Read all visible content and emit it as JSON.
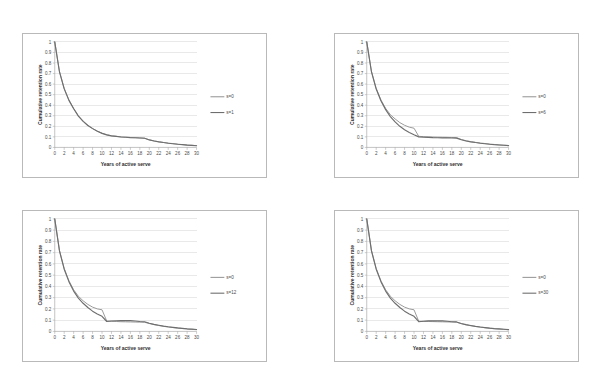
{
  "figure": {
    "layout": "2x2 grid of line chart panels",
    "panel_order": [
      "chart_a",
      "chart_b",
      "chart_c",
      "chart_d"
    ]
  },
  "axis": {
    "xlabel": "Years of active serve",
    "ylabel": "Cumulative retention rate",
    "x_ticks": [
      0,
      2,
      4,
      6,
      8,
      10,
      12,
      14,
      16,
      18,
      20,
      22,
      24,
      26,
      28,
      30
    ],
    "y_ticks": [
      "0",
      "0.1",
      "0.2",
      "0.3",
      "0.4",
      "0.5",
      "0.6",
      "0.7",
      "0.8",
      "0.9",
      "1"
    ]
  },
  "colors": {
    "baseline_series": "#9a9a9a",
    "comparison_series": "#6e6e6e",
    "gridline": "#d2d2d2",
    "axis": "#9a9a9a",
    "panel_border": "#b9b9b9",
    "background": "#ffffff",
    "text": "#3a3a3a"
  },
  "chart_data": [
    {
      "id": "chart_a",
      "type": "line",
      "title": "",
      "xlabel": "Years of active serve",
      "ylabel": "Cumulative retention rate",
      "xlim": [
        0,
        30
      ],
      "ylim": [
        0,
        1
      ],
      "grid": true,
      "legend_position": "right",
      "x": [
        0,
        1,
        2,
        3,
        4,
        5,
        6,
        7,
        8,
        9,
        10,
        11,
        12,
        13,
        14,
        15,
        16,
        17,
        18,
        19,
        20,
        21,
        22,
        23,
        24,
        25,
        26,
        27,
        28,
        29,
        30
      ],
      "series": [
        {
          "name": "s=0",
          "values": [
            1.0,
            0.72,
            0.56,
            0.45,
            0.37,
            0.3,
            0.25,
            0.21,
            0.18,
            0.155,
            0.135,
            0.12,
            0.11,
            0.105,
            0.1,
            0.097,
            0.094,
            0.092,
            0.09,
            0.088,
            0.072,
            0.062,
            0.054,
            0.047,
            0.041,
            0.036,
            0.031,
            0.027,
            0.023,
            0.02,
            0.017
          ]
        },
        {
          "name": "s=1",
          "values": [
            1.0,
            0.715,
            0.555,
            0.446,
            0.366,
            0.297,
            0.247,
            0.208,
            0.178,
            0.153,
            0.133,
            0.119,
            0.109,
            0.104,
            0.099,
            0.096,
            0.093,
            0.091,
            0.089,
            0.087,
            0.071,
            0.061,
            0.053,
            0.046,
            0.04,
            0.035,
            0.03,
            0.026,
            0.022,
            0.019,
            0.016
          ]
        }
      ]
    },
    {
      "id": "chart_b",
      "type": "line",
      "title": "",
      "xlabel": "Years of active serve",
      "ylabel": "Cumulative retention rate",
      "xlim": [
        0,
        30
      ],
      "ylim": [
        0,
        1
      ],
      "grid": true,
      "legend_position": "right",
      "x": [
        0,
        1,
        2,
        3,
        4,
        5,
        6,
        7,
        8,
        9,
        10,
        11,
        12,
        13,
        14,
        15,
        16,
        17,
        18,
        19,
        20,
        21,
        22,
        23,
        24,
        25,
        26,
        27,
        28,
        29,
        30
      ],
      "series": [
        {
          "name": "s=0",
          "values": [
            1.0,
            0.72,
            0.56,
            0.45,
            0.37,
            0.31,
            0.27,
            0.235,
            0.21,
            0.192,
            0.182,
            0.105,
            0.102,
            0.1,
            0.098,
            0.097,
            0.096,
            0.095,
            0.094,
            0.093,
            0.075,
            0.064,
            0.055,
            0.048,
            0.042,
            0.037,
            0.032,
            0.028,
            0.024,
            0.021,
            0.018
          ]
        },
        {
          "name": "s=6",
          "values": [
            1.0,
            0.715,
            0.553,
            0.442,
            0.358,
            0.292,
            0.242,
            0.2,
            0.168,
            0.142,
            0.12,
            0.1,
            0.097,
            0.095,
            0.093,
            0.092,
            0.091,
            0.09,
            0.089,
            0.088,
            0.072,
            0.061,
            0.053,
            0.046,
            0.04,
            0.035,
            0.03,
            0.026,
            0.023,
            0.02,
            0.017
          ]
        }
      ]
    },
    {
      "id": "chart_c",
      "type": "line",
      "title": "",
      "xlabel": "Years of active serve",
      "ylabel": "Cumulative retention rate",
      "xlim": [
        0,
        30
      ],
      "ylim": [
        0,
        1
      ],
      "grid": true,
      "legend_position": "right",
      "x": [
        0,
        1,
        2,
        3,
        4,
        5,
        6,
        7,
        8,
        9,
        10,
        11,
        12,
        13,
        14,
        15,
        16,
        17,
        18,
        19,
        20,
        21,
        22,
        23,
        24,
        25,
        26,
        27,
        28,
        29,
        30
      ],
      "series": [
        {
          "name": "s=0",
          "values": [
            1.0,
            0.72,
            0.56,
            0.45,
            0.37,
            0.312,
            0.272,
            0.24,
            0.216,
            0.2,
            0.192,
            0.092,
            0.09,
            0.088,
            0.086,
            0.085,
            0.084,
            0.083,
            0.082,
            0.081,
            0.07,
            0.06,
            0.052,
            0.045,
            0.039,
            0.034,
            0.029,
            0.025,
            0.021,
            0.018,
            0.015
          ]
        },
        {
          "name": "s=12",
          "values": [
            1.0,
            0.715,
            0.553,
            0.442,
            0.358,
            0.296,
            0.25,
            0.212,
            0.18,
            0.155,
            0.134,
            0.088,
            0.092,
            0.095,
            0.096,
            0.096,
            0.096,
            0.092,
            0.088,
            0.086,
            0.072,
            0.062,
            0.054,
            0.047,
            0.041,
            0.036,
            0.031,
            0.027,
            0.023,
            0.02,
            0.017
          ]
        }
      ]
    },
    {
      "id": "chart_d",
      "type": "line",
      "title": "",
      "xlabel": "Years of active serve",
      "ylabel": "Cumulative retention rate",
      "xlim": [
        0,
        30
      ],
      "ylim": [
        0,
        1
      ],
      "grid": true,
      "legend_position": "right",
      "x": [
        0,
        1,
        2,
        3,
        4,
        5,
        6,
        7,
        8,
        9,
        10,
        11,
        12,
        13,
        14,
        15,
        16,
        17,
        18,
        19,
        20,
        21,
        22,
        23,
        24,
        25,
        26,
        27,
        28,
        29,
        30
      ],
      "series": [
        {
          "name": "s=0",
          "values": [
            1.0,
            0.72,
            0.56,
            0.45,
            0.37,
            0.312,
            0.272,
            0.24,
            0.216,
            0.2,
            0.192,
            0.09,
            0.089,
            0.088,
            0.087,
            0.086,
            0.085,
            0.084,
            0.083,
            0.082,
            0.068,
            0.058,
            0.05,
            0.044,
            0.038,
            0.033,
            0.028,
            0.024,
            0.021,
            0.018,
            0.015
          ]
        },
        {
          "name": "s=30",
          "values": [
            1.0,
            0.715,
            0.553,
            0.442,
            0.358,
            0.296,
            0.25,
            0.212,
            0.18,
            0.155,
            0.134,
            0.086,
            0.09,
            0.093,
            0.094,
            0.094,
            0.093,
            0.09,
            0.086,
            0.084,
            0.07,
            0.06,
            0.052,
            0.045,
            0.039,
            0.034,
            0.029,
            0.025,
            0.022,
            0.019,
            0.016
          ]
        }
      ]
    }
  ]
}
